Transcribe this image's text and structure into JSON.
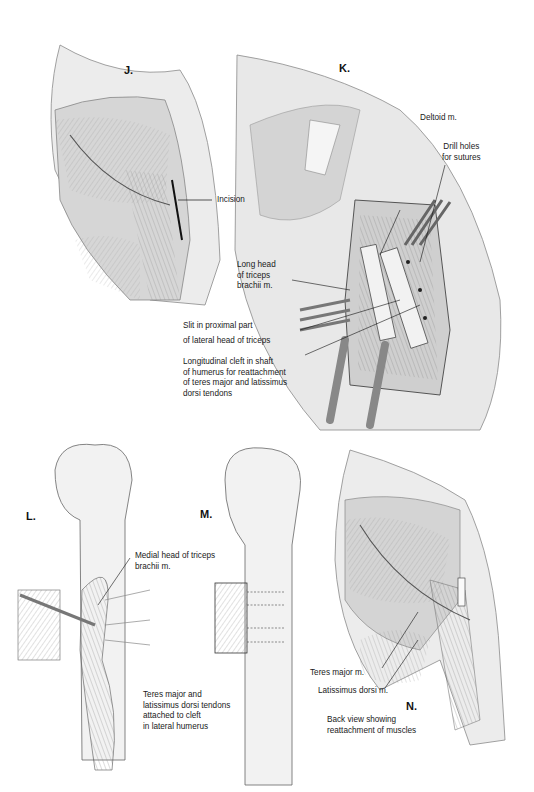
{
  "panels": {
    "J": {
      "letter": "J.",
      "labels": {
        "incision": "Incision"
      }
    },
    "K": {
      "letter": "K.",
      "labels": {
        "deltoid": "Deltoid m.",
        "drill_holes": "Drill holes\nfor sutures",
        "long_head": "Long head\nof triceps\nbrachii m.",
        "slit": "Slit in proximal part\nof lateral head of triceps",
        "cleft": "Longitudinal cleft in shaft\nof humerus for reattachment\nof teres major and latissimus\ndorsi tendons"
      }
    },
    "L": {
      "letter": "L.",
      "labels": {
        "medial_head": "Medial head of triceps\nbrachii m.",
        "tendons": "Teres major and\nlatissimus dorsi tendons\nattached to cleft\nin lateral humerus"
      }
    },
    "M": {
      "letter": "M.",
      "labels": {}
    },
    "N": {
      "letter": "N.",
      "labels": {
        "teres_major": "Teres major m.",
        "latissimus": "Latissimus dorsi m.",
        "caption": "Back view showing\nreattachment of muscles"
      }
    }
  },
  "colors": {
    "tissue": "#d9d9d9",
    "outline": "#6a6a6a",
    "ink": "#1a1a1a",
    "bone": "#f2f2f2"
  }
}
